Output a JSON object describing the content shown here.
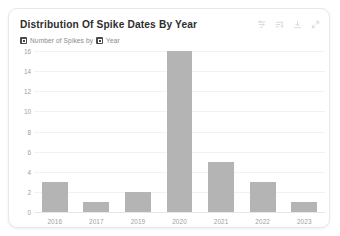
{
  "card": {
    "title": "Distribution Of Spike Dates By Year",
    "legend": {
      "measure_label": "Number of Spikes by",
      "dimension_label": "Year",
      "measure_badge_icon": "measure-field-icon",
      "dimension_badge_icon": "dimension-field-icon"
    },
    "toolbar": {
      "items": [
        {
          "icon": "filter-icon",
          "label": "Filter"
        },
        {
          "icon": "sort-icon",
          "label": "Sort"
        },
        {
          "icon": "download-icon",
          "label": "Download"
        },
        {
          "icon": "expand-icon",
          "label": "Expand"
        }
      ]
    },
    "colors": {
      "bar_fill": "#b4b4b4",
      "gridline": "#f2f2f2",
      "axis_text": "#a0a0a0",
      "title_text": "#2e2e2e",
      "card_border": "#e8e8e8"
    }
  },
  "chart_data": {
    "type": "bar",
    "title": "Distribution Of Spike Dates By Year",
    "subtitle": "Number of Spikes by Year",
    "xlabel": "Year",
    "ylabel": "Number of Spikes",
    "categories": [
      "2016",
      "2017",
      "2019",
      "2020",
      "2021",
      "2022",
      "2023"
    ],
    "values": [
      3,
      1,
      2,
      16,
      5,
      3,
      1
    ],
    "ylim": [
      0,
      16
    ],
    "yticks": [
      0,
      2,
      4,
      6,
      8,
      10,
      12,
      14,
      16
    ],
    "ytick_step": 2,
    "grid": "horizontal",
    "legend": "none",
    "series": [
      {
        "name": "Number of Spikes",
        "values": [
          3,
          1,
          2,
          16,
          5,
          3,
          1
        ]
      }
    ]
  }
}
